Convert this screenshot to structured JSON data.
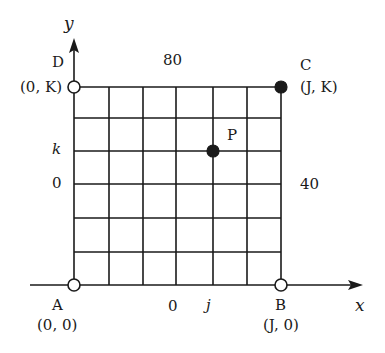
{
  "axes": {
    "x_label": "x",
    "y_label": "y"
  },
  "grid": {
    "columns": 6,
    "rows": 6,
    "line_color": "#1a1a1a"
  },
  "points": {
    "A": {
      "name": "A",
      "coords": "(0, 0)",
      "style": "open"
    },
    "B": {
      "name": "B",
      "coords": "(J, 0)",
      "style": "open"
    },
    "C": {
      "name": "C",
      "coords": "(J, K)",
      "style": "filled"
    },
    "D": {
      "name": "D",
      "coords": "(0, K)",
      "style": "open"
    },
    "P": {
      "name": "P",
      "style": "filled"
    }
  },
  "edge_labels": {
    "top": "80",
    "right": "40",
    "bottom": "0",
    "left": "0"
  },
  "tick_labels": {
    "j": "j",
    "k": "k"
  }
}
